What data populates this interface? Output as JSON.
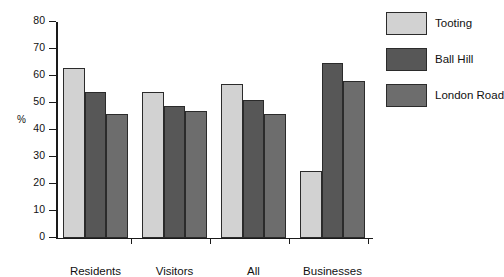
{
  "chart_data": {
    "type": "bar",
    "title": "",
    "xlabel": "",
    "ylabel": "%",
    "ylim": [
      0,
      80
    ],
    "yticks": [
      0,
      10,
      20,
      30,
      40,
      50,
      60,
      70,
      80
    ],
    "grid": false,
    "legend_position": "right",
    "categories": [
      "Residents",
      "Visitors",
      "All",
      "Businesses"
    ],
    "series": [
      {
        "name": "Tooting",
        "color": "#d2d2d2",
        "values": [
          63,
          54,
          57,
          25
        ]
      },
      {
        "name": "Ball Hill",
        "color": "#575757",
        "values": [
          54,
          49,
          51,
          65
        ]
      },
      {
        "name": "London Road",
        "color": "#6d6d6d",
        "values": [
          46,
          47,
          46,
          58
        ]
      }
    ]
  },
  "axis": {
    "unit_label": "%"
  }
}
